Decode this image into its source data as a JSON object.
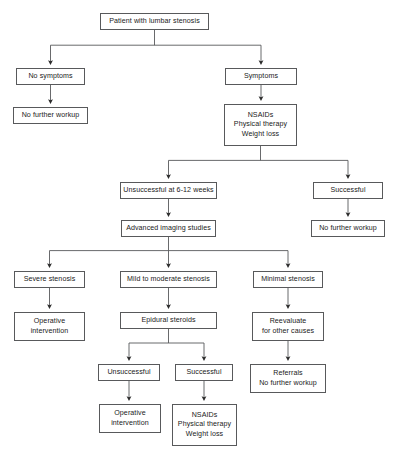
{
  "diagram": {
    "type": "flowchart",
    "colors": {
      "background": "#ffffff",
      "box_border": "#58595b",
      "connector": "#58595b",
      "text": "#1a1a1a"
    },
    "nodes": [
      {
        "id": "patient",
        "lines": [
          "Patient with lumbar stenosis"
        ],
        "x": 100,
        "y": 13,
        "w": 109,
        "h": 17
      },
      {
        "id": "no-symptoms",
        "lines": [
          "No symptoms"
        ],
        "x": 16,
        "y": 68,
        "w": 69,
        "h": 17
      },
      {
        "id": "no-further-workup-1",
        "lines": [
          "No further workup"
        ],
        "x": 13,
        "y": 107,
        "w": 75,
        "h": 17
      },
      {
        "id": "symptoms",
        "lines": [
          "Symptoms"
        ],
        "x": 225,
        "y": 68,
        "w": 72,
        "h": 17
      },
      {
        "id": "conservative-1",
        "lines": [
          "NSAIDs",
          "Physical therapy",
          "Weight loss"
        ],
        "x": 224,
        "y": 104,
        "w": 73,
        "h": 42
      },
      {
        "id": "unsuccessful-6-12",
        "lines": [
          "Unsuccessful at 6-12 weeks"
        ],
        "x": 120,
        "y": 182,
        "w": 97,
        "h": 17
      },
      {
        "id": "successful-1",
        "lines": [
          "Successful"
        ],
        "x": 313,
        "y": 182,
        "w": 70,
        "h": 17
      },
      {
        "id": "advanced-imaging",
        "lines": [
          "Advanced imaging studies"
        ],
        "x": 121,
        "y": 220,
        "w": 95,
        "h": 17
      },
      {
        "id": "no-further-workup-2",
        "lines": [
          "No further workup"
        ],
        "x": 311,
        "y": 220,
        "w": 74,
        "h": 17
      },
      {
        "id": "severe-stenosis",
        "lines": [
          "Severe stenosis"
        ],
        "x": 14,
        "y": 271,
        "w": 71,
        "h": 17
      },
      {
        "id": "mild-mod-stenosis",
        "lines": [
          "Mild to moderate stenosis"
        ],
        "x": 120,
        "y": 271,
        "w": 97,
        "h": 17
      },
      {
        "id": "minimal-stenosis",
        "lines": [
          "Minimal stenosis"
        ],
        "x": 253,
        "y": 271,
        "w": 70,
        "h": 17
      },
      {
        "id": "operative-1",
        "lines": [
          "Operative",
          "intervention"
        ],
        "x": 14,
        "y": 312,
        "w": 71,
        "h": 29
      },
      {
        "id": "epidural-steroids",
        "lines": [
          "Epidural steroids"
        ],
        "x": 120,
        "y": 312,
        "w": 97,
        "h": 17
      },
      {
        "id": "reevaluate",
        "lines": [
          "Reevaluate",
          "for other causes"
        ],
        "x": 252,
        "y": 312,
        "w": 72,
        "h": 29
      },
      {
        "id": "unsuccessful-2",
        "lines": [
          "Unsuccessful"
        ],
        "x": 98,
        "y": 364,
        "w": 62,
        "h": 17
      },
      {
        "id": "successful-2",
        "lines": [
          "Successful"
        ],
        "x": 175,
        "y": 364,
        "w": 58,
        "h": 17
      },
      {
        "id": "referrals",
        "lines": [
          "Referrals",
          "No further workup"
        ],
        "x": 250,
        "y": 364,
        "w": 76,
        "h": 29
      },
      {
        "id": "operative-2",
        "lines": [
          "Operative",
          "intervention"
        ],
        "x": 99,
        "y": 404,
        "w": 62,
        "h": 29
      },
      {
        "id": "conservative-2",
        "lines": [
          "NSAIDs",
          "Physical therapy",
          "Weight loss"
        ],
        "x": 172,
        "y": 404,
        "w": 65,
        "h": 42
      }
    ],
    "edges": [
      {
        "from": "patient",
        "to": [
          "no-symptoms",
          "symptoms"
        ],
        "style": "split"
      },
      {
        "from": "no-symptoms",
        "to": [
          "no-further-workup-1"
        ],
        "style": "straight"
      },
      {
        "from": "symptoms",
        "to": [
          "conservative-1"
        ],
        "style": "straight"
      },
      {
        "from": "conservative-1",
        "to": [
          "unsuccessful-6-12",
          "successful-1"
        ],
        "style": "split"
      },
      {
        "from": "unsuccessful-6-12",
        "to": [
          "advanced-imaging"
        ],
        "style": "straight"
      },
      {
        "from": "successful-1",
        "to": [
          "no-further-workup-2"
        ],
        "style": "straight"
      },
      {
        "from": "advanced-imaging",
        "to": [
          "severe-stenosis",
          "mild-mod-stenosis",
          "minimal-stenosis"
        ],
        "style": "split"
      },
      {
        "from": "severe-stenosis",
        "to": [
          "operative-1"
        ],
        "style": "straight"
      },
      {
        "from": "mild-mod-stenosis",
        "to": [
          "epidural-steroids"
        ],
        "style": "straight"
      },
      {
        "from": "minimal-stenosis",
        "to": [
          "reevaluate"
        ],
        "style": "straight"
      },
      {
        "from": "epidural-steroids",
        "to": [
          "unsuccessful-2",
          "successful-2"
        ],
        "style": "split"
      },
      {
        "from": "reevaluate",
        "to": [
          "referrals"
        ],
        "style": "straight"
      },
      {
        "from": "unsuccessful-2",
        "to": [
          "operative-2"
        ],
        "style": "straight"
      },
      {
        "from": "successful-2",
        "to": [
          "conservative-2"
        ],
        "style": "straight"
      }
    ]
  }
}
